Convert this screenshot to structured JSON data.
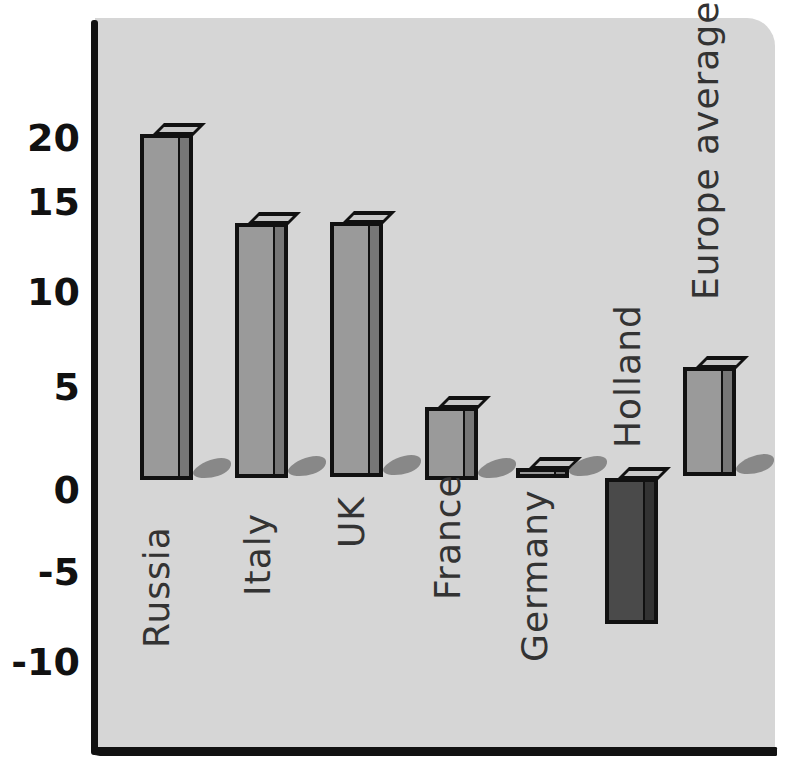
{
  "chart_data": {
    "type": "bar",
    "title": "",
    "xlabel": "",
    "ylabel": "",
    "categories": [
      "Russia",
      "Italy",
      "UK",
      "France",
      "Germany",
      "Holland",
      "Europe average"
    ],
    "values": [
      19,
      14,
      14,
      4,
      0.5,
      -8,
      6
    ],
    "ylim": [
      -12,
      24
    ],
    "yticks": [
      20,
      15,
      10,
      5,
      0,
      -5,
      -10
    ],
    "grid": false,
    "legend": null,
    "style": "hand-drawn 3D bars, grey background panel",
    "colors": {
      "positive": "#9a9a9a",
      "negative": "#4a4a4a",
      "panel": "#d6d6d6",
      "axis": "#111111"
    }
  },
  "axis": {
    "tick_labels": [
      "20",
      "15",
      "10",
      "5",
      "0",
      "-5",
      "-10"
    ]
  },
  "bars": [
    {
      "label": "Russia",
      "value": 19
    },
    {
      "label": "Italy",
      "value": 14
    },
    {
      "label": "UK",
      "value": 14
    },
    {
      "label": "France",
      "value": 4
    },
    {
      "label": "Germany",
      "value": 0.5
    },
    {
      "label": "Holland",
      "value": -8
    },
    {
      "label": "Europe average",
      "value": 6
    }
  ]
}
